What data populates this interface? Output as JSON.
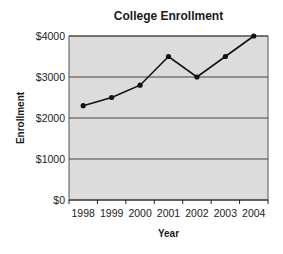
{
  "chart": {
    "title": "College Enrollment",
    "xlabel": "Year",
    "ylabel": "Enrollment"
  },
  "chart_data": {
    "type": "line",
    "title": "College Enrollment",
    "xlabel": "Year",
    "ylabel": "Enrollment",
    "categories": [
      "1998",
      "1999",
      "2000",
      "2001",
      "2002",
      "2003",
      "2004"
    ],
    "values": [
      2300,
      2500,
      2800,
      3500,
      3000,
      3500,
      4000
    ],
    "ylim": [
      0,
      4000
    ],
    "yticks": [
      0,
      1000,
      2000,
      3000,
      4000
    ],
    "ytick_labels": [
      "$0",
      "$1000",
      "$2000",
      "$3000",
      "$4000"
    ],
    "grid": true,
    "legend": null,
    "colors": {
      "background": "#dcdcdc",
      "line": "#111111",
      "grid": "#444444"
    }
  }
}
